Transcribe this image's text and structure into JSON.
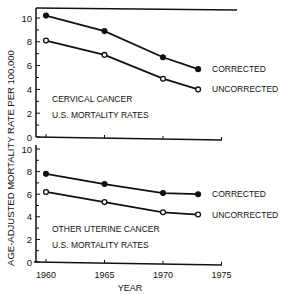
{
  "chart_data": [
    {
      "type": "line",
      "panel": "top",
      "title": "CERVICAL CANCER",
      "subtitle": "U.S. MORTALITY RATES",
      "x": [
        1960,
        1965,
        1970,
        1973
      ],
      "series": [
        {
          "name": "CORRECTED",
          "marker": "filled",
          "values": [
            10.2,
            8.9,
            6.7,
            5.7
          ]
        },
        {
          "name": "UNCORRECTED",
          "marker": "open",
          "values": [
            8.1,
            6.9,
            4.9,
            4.0
          ]
        }
      ],
      "ylim": [
        0,
        10
      ],
      "yticks": [
        "0",
        "2",
        "4",
        "6",
        "8",
        "10"
      ]
    },
    {
      "type": "line",
      "panel": "bottom",
      "title": "OTHER UTERINE CANCER",
      "subtitle": "U.S. MORTALITY RATES",
      "x": [
        1960,
        1965,
        1970,
        1973
      ],
      "series": [
        {
          "name": "CORRECTED",
          "marker": "filled",
          "values": [
            7.8,
            6.9,
            6.1,
            6.0
          ]
        },
        {
          "name": "UNCORRECTED",
          "marker": "open",
          "values": [
            6.2,
            5.3,
            4.4,
            4.2
          ]
        }
      ],
      "ylim": [
        0,
        10
      ],
      "yticks": [
        "0",
        "2",
        "4",
        "6",
        "8",
        "10"
      ]
    }
  ],
  "axes": {
    "ylabel": "AGE-ADJUSTED MORTALITY RATE PER 100,000",
    "xlabel": "YEAR",
    "xticks": [
      "1960",
      "1965",
      "1970",
      "1975"
    ]
  }
}
